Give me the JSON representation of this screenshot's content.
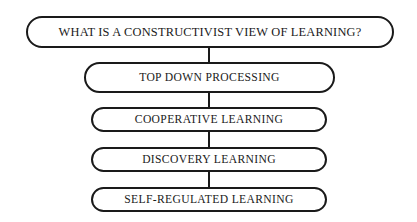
{
  "diagram": {
    "type": "flowchart-vertical",
    "background_color": "#ffffff",
    "line_color": "#1a1a1a",
    "text_color": "#1a1a1a",
    "nodes": [
      {
        "id": "root-question",
        "label": "WHAT IS A CONSTRUCTIVIST VIEW OF LEARNING?",
        "shape": "stadium"
      },
      {
        "id": "top-down-processing",
        "label": "TOP DOWN PROCESSING",
        "shape": "stadium"
      },
      {
        "id": "cooperative-learning",
        "label": "COOPERATIVE LEARNING",
        "shape": "stadium"
      },
      {
        "id": "discovery-learning",
        "label": "DISCOVERY LEARNING",
        "shape": "stadium"
      },
      {
        "id": "self-regulated-learning",
        "label": "SELF-REGULATED LEARNING",
        "shape": "stadium"
      }
    ],
    "connectors": [
      {
        "from": "root-question",
        "to": "top-down-processing",
        "style": "vertical-line"
      },
      {
        "from": "top-down-processing",
        "to": "cooperative-learning",
        "style": "vertical-line"
      },
      {
        "from": "cooperative-learning",
        "to": "discovery-learning",
        "style": "vertical-line"
      },
      {
        "from": "discovery-learning",
        "to": "self-regulated-learning",
        "style": "vertical-line"
      }
    ]
  }
}
